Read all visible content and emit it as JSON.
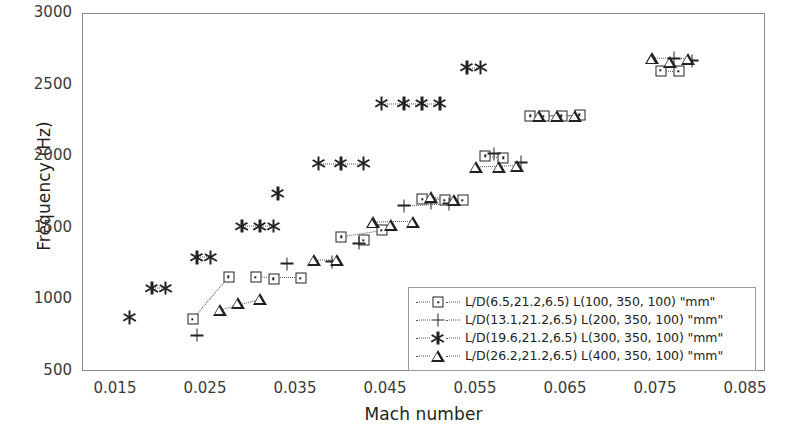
{
  "chart_data": {
    "type": "scatter",
    "title": "",
    "xlabel": "Mach number",
    "ylabel": "Frequency (Hz)",
    "xlim": [
      0.015,
      0.085
    ],
    "ylim": [
      500,
      3000
    ],
    "xticks": [
      "0.015",
      "0.025",
      "0.035",
      "0.045",
      "0.055",
      "0.065",
      "0.075",
      "0.085"
    ],
    "xtick_values": [
      0.015,
      0.025,
      0.035,
      0.045,
      0.055,
      0.065,
      0.075,
      0.085
    ],
    "yticks": [
      "500",
      "1000",
      "1500",
      "2000",
      "2500",
      "3000"
    ],
    "ytick_values": [
      500,
      1000,
      1500,
      2000,
      2500,
      3000
    ],
    "grid": false,
    "legend_position": "inside-lower-right",
    "series": [
      {
        "name": "L/D(6.5,21.2,6.5)  L(100, 350, 100) \"mm\"",
        "marker": "square",
        "linestyle": "dotted",
        "x": [
          0.0235,
          0.0275,
          0.0305,
          0.0325,
          0.0355,
          0.04,
          0.0425,
          0.0445,
          0.049,
          0.0515,
          0.0535,
          0.056,
          0.058,
          0.061,
          0.0625,
          0.0645,
          0.0665,
          0.0755,
          0.0775
        ],
        "y": [
          870,
          1165,
          1160,
          1150,
          1155,
          1445,
          1420,
          1490,
          1705,
          1700,
          1700,
          2010,
          1995,
          2290,
          2285,
          2290,
          2295,
          2605,
          2600
        ]
      },
      {
        "name": "L/D(13.1,21.2,6.5) L(200, 350, 100) \"mm\"",
        "marker": "plus",
        "linestyle": "dotted",
        "x": [
          0.024,
          0.034,
          0.039,
          0.042,
          0.047,
          0.05,
          0.052,
          0.057,
          0.06,
          0.077,
          0.079
        ],
        "y": [
          755,
          1255,
          1270,
          1400,
          1660,
          1680,
          1675,
          2025,
          1965,
          2690,
          2675
        ]
      },
      {
        "name": "L/D(19.6,21.2,6.5) L(300, 350, 100) \"mm\"",
        "marker": "asterisk",
        "linestyle": "dotted",
        "x": [
          0.0165,
          0.019,
          0.0205,
          0.024,
          0.0255,
          0.029,
          0.031,
          0.0325,
          0.033,
          0.0375,
          0.04,
          0.0425,
          0.0445,
          0.047,
          0.049,
          0.051,
          0.054,
          0.0555
        ],
        "y": [
          880,
          1085,
          1085,
          1300,
          1300,
          1520,
          1520,
          1520,
          1745,
          1955,
          1955,
          1955,
          2375,
          2375,
          2375,
          2375,
          2625,
          2625
        ]
      },
      {
        "name": "L/D(26.2,21.2,6.5) L(400, 350, 100) \"mm\"",
        "marker": "triangle",
        "linestyle": "dotted",
        "x": [
          0.0265,
          0.0285,
          0.031,
          0.037,
          0.0395,
          0.0435,
          0.0455,
          0.048,
          0.05,
          0.0525,
          0.055,
          0.0575,
          0.0595,
          0.062,
          0.064,
          0.066,
          0.0745,
          0.0765,
          0.0785
        ],
        "y": [
          935,
          980,
          1010,
          1280,
          1280,
          1545,
          1530,
          1550,
          1720,
          1700,
          1930,
          1930,
          1940,
          2290,
          2290,
          2290,
          2690,
          2665,
          2685
        ]
      }
    ],
    "connectors": [
      {
        "series": 0,
        "from": 0,
        "to": 1
      },
      {
        "series": 0,
        "from": 2,
        "to": 4
      },
      {
        "series": 0,
        "from": 5,
        "to": 7
      },
      {
        "series": 0,
        "from": 8,
        "to": 10
      },
      {
        "series": 0,
        "from": 11,
        "to": 12
      },
      {
        "series": 0,
        "from": 13,
        "to": 16
      },
      {
        "series": 0,
        "from": 17,
        "to": 18
      },
      {
        "series": 1,
        "from": 4,
        "to": 6
      },
      {
        "series": 2,
        "from": 1,
        "to": 2
      },
      {
        "series": 2,
        "from": 3,
        "to": 4
      },
      {
        "series": 2,
        "from": 5,
        "to": 7
      },
      {
        "series": 2,
        "from": 9,
        "to": 11
      },
      {
        "series": 2,
        "from": 12,
        "to": 15
      },
      {
        "series": 2,
        "from": 16,
        "to": 17
      },
      {
        "series": 3,
        "from": 0,
        "to": 2
      },
      {
        "series": 3,
        "from": 3,
        "to": 4
      },
      {
        "series": 3,
        "from": 5,
        "to": 7
      },
      {
        "series": 3,
        "from": 8,
        "to": 9
      },
      {
        "series": 3,
        "from": 10,
        "to": 12
      },
      {
        "series": 3,
        "from": 13,
        "to": 15
      },
      {
        "series": 3,
        "from": 16,
        "to": 18
      }
    ]
  },
  "axes": {
    "y_title": "Frequency (Hz)",
    "x_title": "Mach number"
  },
  "legend": {
    "entries": [
      {
        "marker": "square",
        "label": "L/D(6.5,21.2,6.5)  L(100, 350, 100) \"mm\""
      },
      {
        "marker": "plus",
        "label": "L/D(13.1,21.2,6.5) L(200, 350, 100) \"mm\""
      },
      {
        "marker": "asterisk",
        "label": "L/D(19.6,21.2,6.5) L(300, 350, 100) \"mm\""
      },
      {
        "marker": "triangle",
        "label": "L/D(26.2,21.2,6.5) L(400, 350, 100) \"mm\""
      }
    ]
  },
  "colors": {
    "marker": "#222222",
    "frame": "#8c8c8c",
    "connector": "#555555",
    "text": "#231f20"
  }
}
